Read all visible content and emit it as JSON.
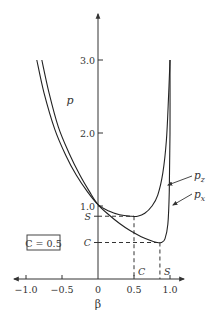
{
  "chart_data": {
    "type": "line",
    "title": "",
    "xlabel": "β",
    "ylabel": "p",
    "xlim": [
      -1.15,
      1.2
    ],
    "ylim": [
      0,
      3.6
    ],
    "x_ticks": [
      -1.0,
      -0.5,
      0,
      0.5,
      1.0
    ],
    "x_tick_labels": [
      "−1.0",
      "−0.5",
      "0",
      "0.5",
      "1.0"
    ],
    "y_ticks": [
      1.0,
      2.0,
      3.0
    ],
    "y_tick_labels": [
      "1.0",
      "2.0",
      "3.0"
    ],
    "grid": false,
    "annotation_box": "C = 0.5",
    "reference_levels": {
      "S": {
        "label": "S",
        "p": 0.86,
        "beta": 0.5,
        "beta_label": "C"
      },
      "C": {
        "label": "C",
        "p": 0.5,
        "beta": 0.86,
        "beta_label": "S"
      }
    },
    "series": [
      {
        "name": "p_z",
        "label_main": "p",
        "label_sub": "z",
        "points": [
          [
            -0.85,
            3.0
          ],
          [
            -0.75,
            2.55
          ],
          [
            -0.6,
            2.05
          ],
          [
            -0.45,
            1.7
          ],
          [
            -0.3,
            1.42
          ],
          [
            -0.15,
            1.2
          ],
          [
            0.0,
            1.02
          ],
          [
            0.15,
            0.93
          ],
          [
            0.3,
            0.88
          ],
          [
            0.45,
            0.86
          ],
          [
            0.55,
            0.86
          ],
          [
            0.65,
            0.9
          ],
          [
            0.75,
            1.0
          ],
          [
            0.83,
            1.15
          ],
          [
            0.9,
            1.45
          ],
          [
            0.95,
            1.9
          ],
          [
            0.98,
            2.5
          ],
          [
            1.0,
            3.0
          ]
        ]
      },
      {
        "name": "p_x",
        "label_main": "p",
        "label_sub": "x",
        "points": [
          [
            -0.78,
            3.0
          ],
          [
            -0.68,
            2.55
          ],
          [
            -0.55,
            2.08
          ],
          [
            -0.4,
            1.72
          ],
          [
            -0.25,
            1.42
          ],
          [
            -0.12,
            1.2
          ],
          [
            0.0,
            1.02
          ],
          [
            0.15,
            0.88
          ],
          [
            0.3,
            0.76
          ],
          [
            0.45,
            0.66
          ],
          [
            0.6,
            0.58
          ],
          [
            0.72,
            0.53
          ],
          [
            0.82,
            0.5
          ],
          [
            0.88,
            0.5
          ],
          [
            0.93,
            0.55
          ],
          [
            0.97,
            0.75
          ],
          [
            0.99,
            1.2
          ],
          [
            1.0,
            2.0
          ],
          [
            1.0,
            3.0
          ]
        ]
      }
    ]
  }
}
